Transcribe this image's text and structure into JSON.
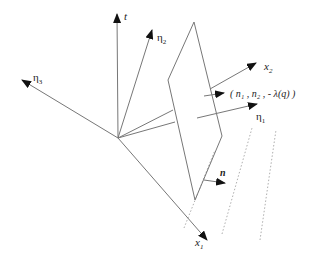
{
  "diagram": {
    "type": "geometric vector diagram",
    "origin": [
      118,
      138
    ],
    "colors": {
      "line": "#777777",
      "arrowhead": "#111111",
      "text": "#222222"
    },
    "axes": [
      {
        "id": "t",
        "label": "t",
        "sub": "",
        "to": [
          117,
          14
        ]
      },
      {
        "id": "eta2",
        "label": "η",
        "sub": "2",
        "to": [
          152,
          30
        ]
      },
      {
        "id": "eta3",
        "label": "η",
        "sub": "3",
        "to": [
          22,
          80
        ]
      },
      {
        "id": "x1",
        "label": "x",
        "sub": "1",
        "to": [
          207,
          240
        ]
      }
    ],
    "plane_vectors": [
      {
        "id": "x2",
        "label": "x",
        "sub": "2"
      },
      {
        "id": "normal",
        "label": "( n₁ , n₂ , - λ(q) )"
      },
      {
        "id": "eta1",
        "label": "η",
        "sub": "1"
      },
      {
        "id": "n",
        "label": "n"
      }
    ]
  }
}
